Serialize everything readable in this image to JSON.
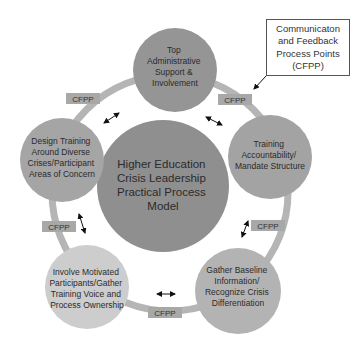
{
  "diagram": {
    "title": "Higher Education Crisis Leadership Practical Process Model",
    "center": {
      "lines": [
        "Higher Education",
        "Crisis Leadership",
        "Practical Process",
        "Model"
      ]
    },
    "nodes": [
      {
        "id": "top",
        "lines": [
          "Top",
          "Administrative",
          "Support &",
          "Involvement"
        ]
      },
      {
        "id": "right",
        "lines": [
          "Training",
          "Accountability/",
          "Mandate Structure"
        ]
      },
      {
        "id": "bottom-right",
        "lines": [
          "Gather Baseline",
          "Information/",
          "Recognize Crisis",
          "Differentiation"
        ]
      },
      {
        "id": "bottom-left",
        "lines": [
          "Involve Motivated",
          "Participants/Gather",
          "Training Voice and",
          "Process Ownership"
        ]
      },
      {
        "id": "left",
        "lines": [
          "Design Training",
          "Around Diverse",
          "Crises/Participant",
          "Areas of Concern"
        ]
      }
    ],
    "cfpp_label": "CFPP",
    "callout": {
      "lines": [
        "Communicaton",
        "and Feedback",
        "Process Points",
        "(CFPP)"
      ]
    },
    "colors": {
      "center_fill": "#8f8f8f",
      "top_fill": "#959595",
      "right_fill": "#a3a3a3",
      "bottom_right_fill": "#b3b3b3",
      "bottom_left_fill": "#cdcdcd",
      "left_fill": "#a5a5a5",
      "ring": "#b5b5b5",
      "cfpp_fill": "#a8a8a8",
      "text": "#2b2b2b"
    }
  }
}
